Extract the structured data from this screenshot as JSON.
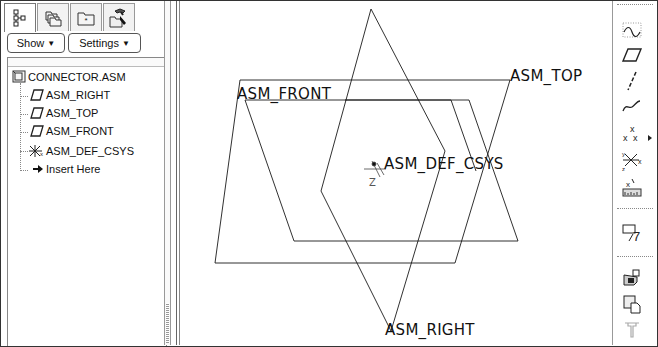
{
  "navigator": {
    "tabs": [
      {
        "name": "model-tree-tab",
        "icon": "model-tree-icon",
        "active": true
      },
      {
        "name": "folder-browser-tab",
        "icon": "folders-icon",
        "active": false
      },
      {
        "name": "favorites-tab",
        "icon": "favorites-folder-icon",
        "active": false
      },
      {
        "name": "connections-tab",
        "icon": "tools-folder-icon",
        "active": false
      }
    ],
    "buttons": {
      "show_label": "Show",
      "settings_label": "Settings",
      "caret": "▼"
    },
    "tree": {
      "root": {
        "label": "CONNECTOR.ASM",
        "icon": "assembly-icon"
      },
      "children": [
        {
          "label": "ASM_RIGHT",
          "icon": "datum-plane-icon"
        },
        {
          "label": "ASM_TOP",
          "icon": "datum-plane-icon"
        },
        {
          "label": "ASM_FRONT",
          "icon": "datum-plane-icon"
        },
        {
          "label": "ASM_DEF_CSYS",
          "icon": "coordinate-system-icon"
        },
        {
          "label": "Insert Here",
          "icon": "insert-arrow-icon"
        }
      ]
    }
  },
  "graphics": {
    "labels": {
      "front": "ASM_FRONT",
      "top": "ASM_TOP",
      "right": "ASM_RIGHT",
      "csys": "ASM_DEF_CSYS",
      "csys_axis": "Z"
    },
    "line_color": "#1a1a1a"
  },
  "toolbar_right": {
    "tools": [
      {
        "name": "datum-display-icon"
      },
      {
        "name": "datum-plane-tool-icon"
      },
      {
        "name": "datum-axis-tool-icon"
      },
      {
        "name": "datum-curve-tool-icon"
      },
      {
        "name": "datum-point-tool-icon"
      },
      {
        "name": "coordinate-system-tool-icon"
      },
      {
        "name": "analysis-feature-icon"
      },
      {
        "name": "assemble-component-icon"
      },
      {
        "name": "create-component-icon"
      },
      {
        "name": "package-component-icon"
      },
      {
        "name": "connector-tool-icon"
      }
    ]
  }
}
